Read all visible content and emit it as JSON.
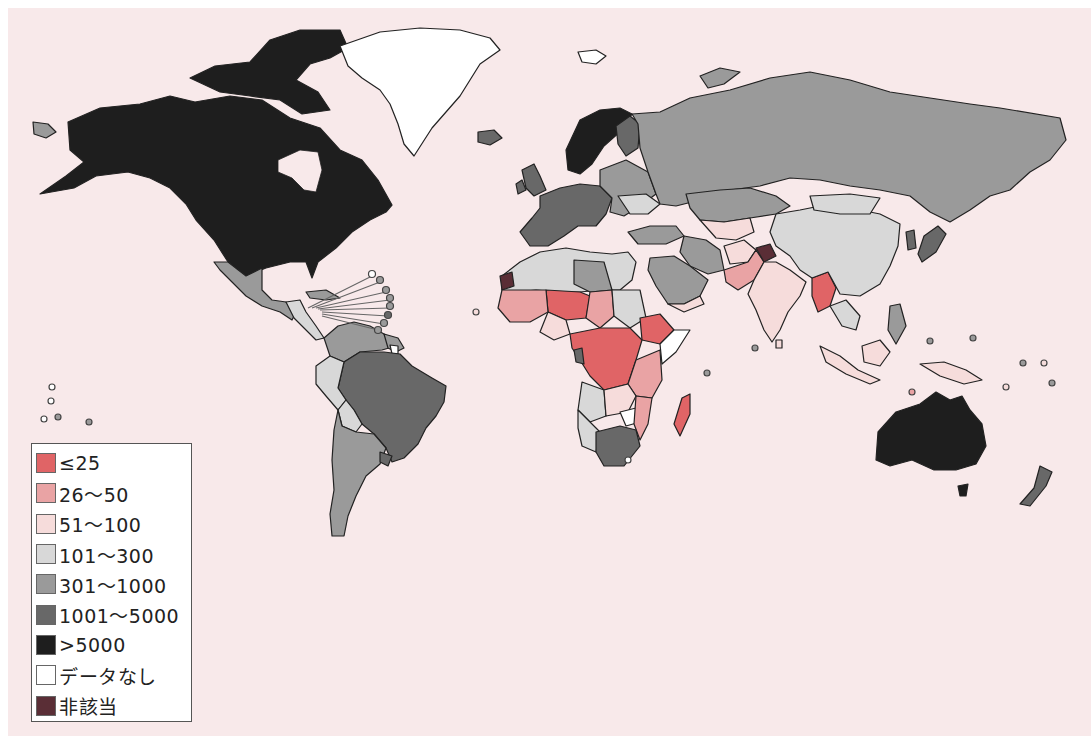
{
  "legend": {
    "items": [
      {
        "label": "≤25",
        "color": "#e06466"
      },
      {
        "label": "26〜50",
        "color": "#e9a3a4"
      },
      {
        "label": "51〜100",
        "color": "#f6dcdb"
      },
      {
        "label": "101〜300",
        "color": "#d8d8d8"
      },
      {
        "label": "301〜1000",
        "color": "#9a9a9a"
      },
      {
        "label": "1001〜5000",
        "color": "#686868"
      },
      {
        "label": ">5000",
        "color": "#1e1e1e"
      },
      {
        "label": "データなし",
        "color": "#ffffff"
      },
      {
        "label": "非該当",
        "color": "#5a2e36"
      }
    ]
  },
  "colors": {
    "background": "#f8e9ea",
    "border": "#222222",
    "le25": "#e06466",
    "c26_50": "#e9a3a4",
    "c51_100": "#f6dcdb",
    "c101_300": "#d8d8d8",
    "c301_1000": "#9a9a9a",
    "c1001_5000": "#686868",
    "gt5000": "#1e1e1e",
    "no_data": "#ffffff",
    "not_applicable": "#5a2e36"
  }
}
